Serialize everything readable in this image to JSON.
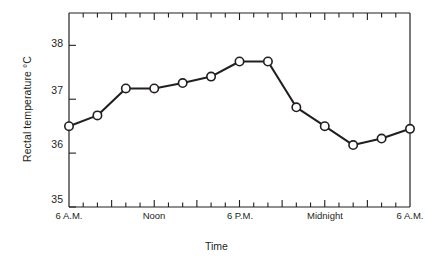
{
  "chart_data": {
    "type": "line",
    "title": "",
    "xlabel": "Time",
    "ylabel": "Rectal temperature °C",
    "ylim": [
      35,
      38.6
    ],
    "xlim": [
      0,
      24
    ],
    "grid": false,
    "legend": null,
    "marker": "open-circle",
    "line_color": "#231f20",
    "marker_fill": "#ffffff",
    "marker_edge": "#231f20",
    "ytick_values": [
      35,
      36,
      37,
      38
    ],
    "ytick_labels": [
      "35",
      "36",
      "37",
      "38"
    ],
    "xtick_labels": [
      "6 A.M.",
      "Noon",
      "6 P.M.",
      "Midnight",
      "6 A.M."
    ],
    "xtick_label_hours": [
      0,
      6,
      12,
      18,
      24
    ],
    "x_hours": [
      0,
      2,
      4,
      6,
      8,
      10,
      12,
      14,
      16,
      18,
      20,
      22,
      24
    ],
    "x_times": [
      "6 A.M.",
      "8 A.M.",
      "10 A.M.",
      "Noon",
      "2 P.M.",
      "4 P.M.",
      "6 P.M.",
      "8 P.M.",
      "10 P.M.",
      "Midnight",
      "2 A.M.",
      "4 A.M.",
      "6 A.M."
    ],
    "values": [
      36.5,
      36.7,
      37.2,
      37.2,
      37.3,
      37.42,
      37.7,
      37.7,
      36.85,
      36.5,
      36.15,
      36.27,
      36.45
    ],
    "minor_tick_interval_hours": 1,
    "major_tick_interval_hours": 3
  },
  "axis": {
    "ylabel_text": "Rectal temperature °C",
    "xlabel_text": "Time"
  }
}
